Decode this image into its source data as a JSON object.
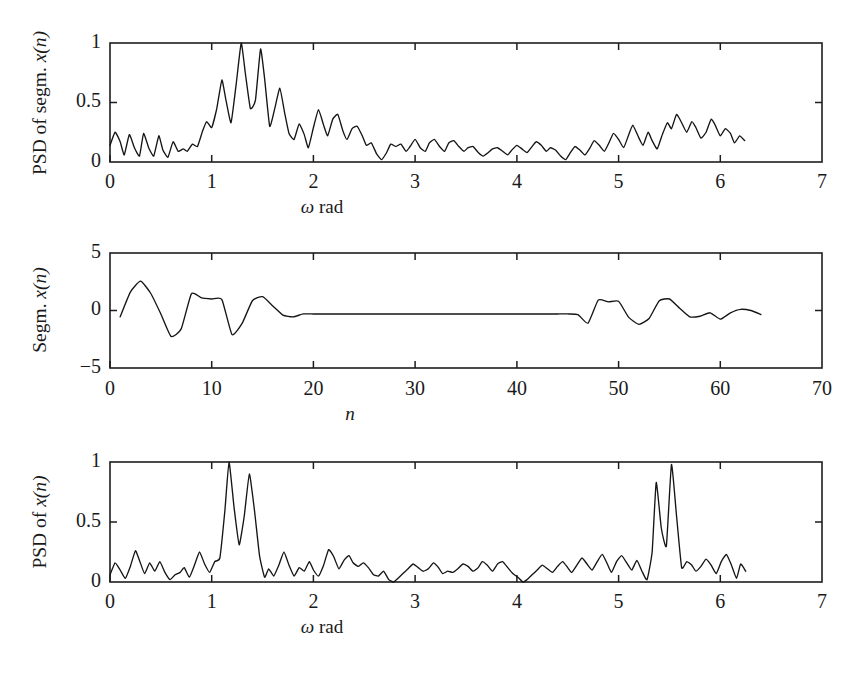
{
  "figure": {
    "background": "#ffffff",
    "line_color": "#151515",
    "axis_color": "#1d1d1d"
  },
  "panels": {
    "top": {
      "ylabel_plain": "PSD of segm. ",
      "ylabel_math": "x(n)",
      "xlabel_sym": "ω",
      "xlabel_text": " rad",
      "xticks": [
        "0",
        "1",
        "2",
        "3",
        "4",
        "5",
        "6",
        "7"
      ],
      "yticks": [
        "0",
        "0.5",
        "1"
      ]
    },
    "middle": {
      "ylabel_plain": "Segm. ",
      "ylabel_math": "x(n)",
      "xlabel_math": "n",
      "xticks": [
        "0",
        "10",
        "20",
        "30",
        "40",
        "50",
        "60",
        "70"
      ],
      "yticks": [
        "−5",
        "0",
        "5"
      ]
    },
    "bottom": {
      "ylabel_plain": "PSD of ",
      "ylabel_math": "x(n)",
      "xlabel_sym": "ω",
      "xlabel_text": " rad",
      "xticks": [
        "0",
        "1",
        "2",
        "3",
        "4",
        "5",
        "6",
        "7"
      ],
      "yticks": [
        "0",
        "0.5",
        "1"
      ]
    }
  },
  "chart_data": [
    {
      "type": "line",
      "id": "psd-of-segment",
      "title": "",
      "xlabel": "ω rad",
      "ylabel": "PSD of segm. x(n)",
      "xlim": [
        0,
        7
      ],
      "ylim": [
        0,
        1
      ],
      "xticks": [
        0,
        1,
        2,
        3,
        4,
        5,
        6,
        7
      ],
      "yticks": [
        0,
        0.5,
        1
      ],
      "grid": false,
      "legend": null,
      "x": [
        0.0,
        0.05,
        0.1,
        0.14,
        0.19,
        0.24,
        0.29,
        0.33,
        0.38,
        0.43,
        0.48,
        0.52,
        0.57,
        0.62,
        0.67,
        0.72,
        0.76,
        0.81,
        0.86,
        0.91,
        0.95,
        1.0,
        1.05,
        1.1,
        1.14,
        1.19,
        1.24,
        1.29,
        1.33,
        1.38,
        1.43,
        1.48,
        1.52,
        1.57,
        1.62,
        1.67,
        1.72,
        1.76,
        1.81,
        1.86,
        1.91,
        1.95,
        2.0,
        2.05,
        2.1,
        2.14,
        2.19,
        2.24,
        2.29,
        2.33,
        2.38,
        2.43,
        2.48,
        2.52,
        2.57,
        2.62,
        2.67,
        2.72,
        2.76,
        2.81,
        2.86,
        2.91,
        2.95,
        3.0,
        3.05,
        3.1,
        3.14,
        3.19,
        3.24,
        3.29,
        3.33,
        3.38,
        3.43,
        3.48,
        3.52,
        3.57,
        3.62,
        3.67,
        3.72,
        3.76,
        3.81,
        3.86,
        3.91,
        3.95,
        4.0,
        4.05,
        4.1,
        4.14,
        4.19,
        4.24,
        4.29,
        4.33,
        4.38,
        4.43,
        4.48,
        4.52,
        4.57,
        4.62,
        4.67,
        4.72,
        4.76,
        4.81,
        4.86,
        4.91,
        4.95,
        5.0,
        5.05,
        5.1,
        5.14,
        5.19,
        5.24,
        5.29,
        5.33,
        5.38,
        5.43,
        5.48,
        5.52,
        5.57,
        5.62,
        5.67,
        5.72,
        5.76,
        5.81,
        5.86,
        5.91,
        5.95,
        6.0,
        6.05,
        6.1,
        6.14,
        6.19,
        6.24
      ],
      "y": [
        0.14,
        0.25,
        0.17,
        0.06,
        0.23,
        0.12,
        0.05,
        0.24,
        0.12,
        0.05,
        0.22,
        0.1,
        0.04,
        0.17,
        0.09,
        0.11,
        0.09,
        0.15,
        0.13,
        0.26,
        0.34,
        0.29,
        0.45,
        0.69,
        0.52,
        0.33,
        0.65,
        1.0,
        0.75,
        0.45,
        0.52,
        0.95,
        0.7,
        0.3,
        0.45,
        0.62,
        0.4,
        0.24,
        0.19,
        0.32,
        0.23,
        0.12,
        0.29,
        0.44,
        0.31,
        0.22,
        0.36,
        0.4,
        0.26,
        0.19,
        0.28,
        0.3,
        0.22,
        0.14,
        0.16,
        0.07,
        0.02,
        0.08,
        0.15,
        0.13,
        0.15,
        0.09,
        0.13,
        0.19,
        0.12,
        0.09,
        0.16,
        0.19,
        0.13,
        0.09,
        0.16,
        0.18,
        0.13,
        0.09,
        0.12,
        0.13,
        0.08,
        0.05,
        0.08,
        0.11,
        0.12,
        0.09,
        0.06,
        0.1,
        0.14,
        0.11,
        0.08,
        0.12,
        0.17,
        0.14,
        0.09,
        0.12,
        0.1,
        0.05,
        0.02,
        0.07,
        0.13,
        0.1,
        0.06,
        0.12,
        0.18,
        0.14,
        0.09,
        0.17,
        0.24,
        0.19,
        0.12,
        0.23,
        0.31,
        0.22,
        0.14,
        0.25,
        0.18,
        0.11,
        0.23,
        0.33,
        0.28,
        0.4,
        0.33,
        0.25,
        0.34,
        0.29,
        0.2,
        0.25,
        0.36,
        0.31,
        0.22,
        0.28,
        0.24,
        0.16,
        0.22,
        0.18
      ]
    },
    {
      "type": "line",
      "id": "segment-signal",
      "title": "",
      "xlabel": "n",
      "ylabel": "Segm. x(n)",
      "xlim": [
        0,
        70
      ],
      "ylim": [
        -5,
        5
      ],
      "xticks": [
        0,
        10,
        20,
        30,
        40,
        50,
        60,
        70
      ],
      "yticks": [
        -5,
        0,
        5
      ],
      "grid": false,
      "legend": null,
      "x": [
        1,
        2,
        3,
        4,
        5,
        6,
        7,
        8,
        9,
        10,
        11,
        12,
        13,
        14,
        15,
        16,
        17,
        18,
        19,
        20,
        21,
        22,
        23,
        24,
        25,
        26,
        27,
        28,
        29,
        30,
        31,
        32,
        33,
        34,
        35,
        36,
        37,
        38,
        39,
        40,
        41,
        42,
        43,
        44,
        45,
        46,
        47,
        48,
        49,
        50,
        51,
        52,
        53,
        54,
        55,
        56,
        57,
        58,
        59,
        60,
        61,
        62,
        63,
        64
      ],
      "y": [
        -0.55,
        1.6,
        2.55,
        1.5,
        -0.3,
        -2.25,
        -1.6,
        1.45,
        1.1,
        1.0,
        0.95,
        -2.1,
        -1.1,
        0.85,
        1.2,
        0.4,
        -0.4,
        -0.55,
        -0.3,
        -0.3,
        -0.3,
        -0.3,
        -0.3,
        -0.3,
        -0.3,
        -0.3,
        -0.3,
        -0.3,
        -0.3,
        -0.3,
        -0.3,
        -0.3,
        -0.3,
        -0.3,
        -0.3,
        -0.3,
        -0.3,
        -0.3,
        -0.3,
        -0.3,
        -0.3,
        -0.3,
        -0.3,
        -0.3,
        -0.3,
        -0.35,
        -1.1,
        0.9,
        0.75,
        0.8,
        -0.6,
        -1.2,
        -0.7,
        0.85,
        1.0,
        0.2,
        -0.55,
        -0.5,
        -0.2,
        -0.75,
        -0.2,
        0.1,
        0.0,
        -0.35
      ]
    },
    {
      "type": "line",
      "id": "psd-of-full-signal",
      "title": "",
      "xlabel": "ω rad",
      "ylabel": "PSD of x(n)",
      "xlim": [
        0,
        7
      ],
      "ylim": [
        0,
        1
      ],
      "xticks": [
        0,
        1,
        2,
        3,
        4,
        5,
        6,
        7
      ],
      "yticks": [
        0,
        0.5,
        1
      ],
      "grid": false,
      "legend": null,
      "x": [
        0.0,
        0.05,
        0.1,
        0.15,
        0.2,
        0.25,
        0.29,
        0.34,
        0.39,
        0.44,
        0.49,
        0.54,
        0.59,
        0.64,
        0.69,
        0.73,
        0.78,
        0.83,
        0.88,
        0.93,
        0.98,
        1.03,
        1.08,
        1.13,
        1.17,
        1.22,
        1.27,
        1.32,
        1.37,
        1.42,
        1.47,
        1.52,
        1.56,
        1.61,
        1.66,
        1.71,
        1.76,
        1.81,
        1.86,
        1.91,
        1.96,
        2.0,
        2.05,
        2.1,
        2.15,
        2.2,
        2.25,
        2.3,
        2.35,
        2.39,
        2.44,
        2.49,
        2.54,
        2.59,
        2.64,
        2.69,
        2.74,
        2.79,
        2.83,
        2.88,
        2.93,
        2.98,
        3.03,
        3.08,
        3.13,
        3.18,
        3.23,
        3.27,
        3.32,
        3.37,
        3.42,
        3.47,
        3.52,
        3.57,
        3.62,
        3.66,
        3.71,
        3.76,
        3.81,
        3.86,
        3.91,
        3.96,
        4.01,
        4.06,
        4.1,
        4.15,
        4.2,
        4.25,
        4.3,
        4.35,
        4.4,
        4.45,
        4.5,
        4.54,
        4.59,
        4.64,
        4.69,
        4.74,
        4.79,
        4.84,
        4.89,
        4.93,
        4.98,
        5.03,
        5.08,
        5.13,
        5.18,
        5.23,
        5.28,
        5.33,
        5.37,
        5.42,
        5.47,
        5.52,
        5.57,
        5.62,
        5.67,
        5.72,
        5.76,
        5.81,
        5.86,
        5.91,
        5.96,
        6.01,
        6.06,
        6.11,
        6.16,
        6.2,
        6.25
      ],
      "y": [
        0.06,
        0.16,
        0.1,
        0.03,
        0.13,
        0.26,
        0.18,
        0.07,
        0.16,
        0.09,
        0.17,
        0.08,
        0.02,
        0.06,
        0.08,
        0.12,
        0.04,
        0.14,
        0.25,
        0.15,
        0.08,
        0.17,
        0.2,
        0.6,
        1.0,
        0.62,
        0.31,
        0.55,
        0.9,
        0.6,
        0.22,
        0.04,
        0.11,
        0.05,
        0.14,
        0.25,
        0.14,
        0.05,
        0.12,
        0.09,
        0.17,
        0.1,
        0.05,
        0.14,
        0.27,
        0.21,
        0.11,
        0.18,
        0.22,
        0.16,
        0.13,
        0.16,
        0.12,
        0.06,
        0.05,
        0.09,
        0.02,
        0.0,
        0.03,
        0.07,
        0.11,
        0.15,
        0.12,
        0.09,
        0.11,
        0.16,
        0.12,
        0.07,
        0.09,
        0.08,
        0.11,
        0.15,
        0.13,
        0.09,
        0.12,
        0.17,
        0.14,
        0.09,
        0.15,
        0.17,
        0.12,
        0.07,
        0.04,
        0.0,
        0.02,
        0.06,
        0.1,
        0.14,
        0.11,
        0.08,
        0.13,
        0.17,
        0.12,
        0.08,
        0.14,
        0.2,
        0.15,
        0.1,
        0.17,
        0.23,
        0.15,
        0.08,
        0.17,
        0.22,
        0.16,
        0.1,
        0.18,
        0.09,
        0.02,
        0.25,
        0.83,
        0.45,
        0.3,
        0.98,
        0.55,
        0.12,
        0.17,
        0.14,
        0.09,
        0.13,
        0.19,
        0.14,
        0.07,
        0.17,
        0.23,
        0.14,
        0.03,
        0.15,
        0.09,
        0.13
      ]
    }
  ]
}
